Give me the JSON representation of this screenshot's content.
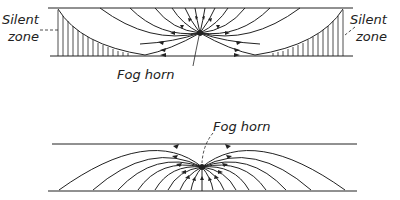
{
  "diagrams": [
    {
      "id": "top",
      "description": "Sound rays from fog horn refracted upward, leaving silent zones near the ground at both sides",
      "labels": {
        "silent_zone_left_line1": "Silent",
        "silent_zone_left_line2": "zone",
        "silent_zone_right_line1": "Silent",
        "silent_zone_right_line2": "zone",
        "source": "Fog horn"
      }
    },
    {
      "id": "bottom",
      "description": "Sound rays from fog horn refracted downward toward the ground, no silent zone",
      "labels": {
        "source": "Fog horn"
      }
    }
  ],
  "colors": {
    "ink": "#222222",
    "background": "#ffffff"
  }
}
